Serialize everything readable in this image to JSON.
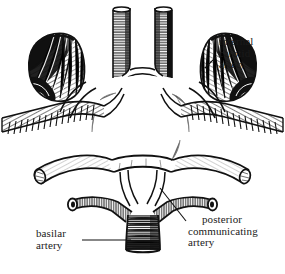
{
  "figure": {
    "style": "black and white engraving / line hatching",
    "background_color": "#ffffff",
    "ink_color": "#111111"
  },
  "labels": {
    "internal_carotid": {
      "name": "internal carotid artery",
      "lines": [
        "internal",
        "carotid",
        "artery"
      ]
    },
    "posterior_communicating": {
      "name": "posterior communicating artery",
      "lines": [
        "posterior",
        "communicating",
        "artery"
      ]
    },
    "basilar": {
      "name": "basilar artery",
      "lines": [
        "basilar",
        "artery"
      ]
    }
  }
}
